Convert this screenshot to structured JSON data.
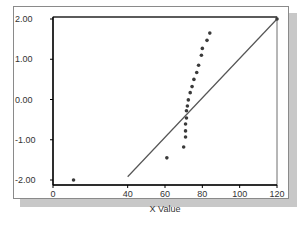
{
  "chart_data": {
    "type": "scatter",
    "title": "",
    "xlabel": "X Value",
    "ylabel": "",
    "xlim": [
      0,
      120
    ],
    "ylim": [
      -2.0,
      2.0
    ],
    "x_ticks": [
      0,
      40,
      60,
      80,
      100,
      120
    ],
    "x_tick_labels": [
      "0",
      "40",
      "60",
      "80",
      "100",
      "120"
    ],
    "y_ticks": [
      2.0,
      1.0,
      0.0,
      -1.0,
      -2.0
    ],
    "y_tick_labels": [
      "2.00",
      "1.00",
      "0.00",
      "-1.00",
      "-2.00"
    ],
    "grid": false,
    "legend": null,
    "series": [
      {
        "name": "Observed",
        "type": "scatter",
        "points": [
          [
            11,
            -2.0
          ],
          [
            61,
            -1.45
          ],
          [
            70,
            -1.18
          ],
          [
            71,
            -0.93
          ],
          [
            71,
            -0.78
          ],
          [
            71,
            -0.61
          ],
          [
            71.5,
            -0.46
          ],
          [
            71.5,
            -0.28
          ],
          [
            72,
            -0.16
          ],
          [
            72.5,
            -0.01
          ],
          [
            73.5,
            0.17
          ],
          [
            74.5,
            0.32
          ],
          [
            75.5,
            0.5
          ],
          [
            77,
            0.67
          ],
          [
            78,
            0.85
          ],
          [
            79.5,
            1.1
          ],
          [
            80,
            1.27
          ],
          [
            82.5,
            1.47
          ],
          [
            84,
            1.65
          ],
          [
            120,
            2.0
          ]
        ]
      },
      {
        "name": "Expected Normal",
        "type": "line",
        "points": [
          [
            40,
            -1.92
          ],
          [
            120,
            2.0
          ]
        ]
      }
    ]
  },
  "colors": {
    "marker": "#3a3a3a",
    "line": "#555555",
    "axis": "#000000",
    "frame": "#8a8a8a",
    "shadow": "#c8c8c8"
  }
}
